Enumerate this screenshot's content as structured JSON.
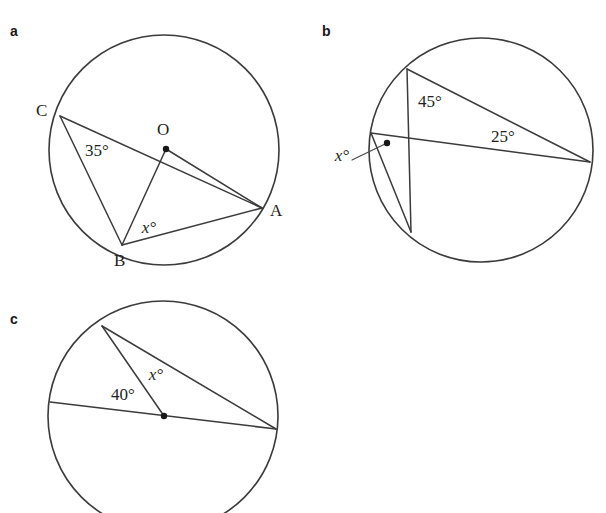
{
  "page": {
    "background": "#ffffff",
    "ink": "#3b3a3c",
    "text_color": "#231f20",
    "cut_off_line": "",
    "width": 606,
    "height": 513
  },
  "figures": [
    {
      "id": "a",
      "part_label": "a",
      "part_label_pos": {
        "x": 10,
        "y": 24
      },
      "circle": {
        "cx": 164,
        "cy": 150,
        "r": 115
      },
      "center_dot": {
        "x": 166,
        "y": 149,
        "r": 3.2
      },
      "points": [
        {
          "name": "A",
          "label": "A",
          "x": 262,
          "y": 208,
          "label_x": 270,
          "label_y": 202
        },
        {
          "name": "B",
          "label": "B",
          "x": 122,
          "y": 245,
          "label_x": 114,
          "label_y": 252
        },
        {
          "name": "C",
          "label": "C",
          "x": 60,
          "y": 116,
          "label_x": 36,
          "label_y": 102
        },
        {
          "name": "O",
          "label": "O",
          "x": 166,
          "y": 149,
          "label_x": 157,
          "label_y": 121
        }
      ],
      "segments": [
        {
          "name": "chord-CA",
          "x1": 60,
          "y1": 116,
          "x2": 262,
          "y2": 208
        },
        {
          "name": "chord-CB",
          "x1": 60,
          "y1": 116,
          "x2": 122,
          "y2": 245
        },
        {
          "name": "chord-BA",
          "x1": 122,
          "y1": 245,
          "x2": 262,
          "y2": 208
        },
        {
          "name": "radius-OB",
          "x1": 166,
          "y1": 149,
          "x2": 122,
          "y2": 245
        },
        {
          "name": "radius-OA",
          "x1": 166,
          "y1": 149,
          "x2": 262,
          "y2": 208
        }
      ],
      "angles": [
        {
          "name": "angle-35",
          "text": "35°",
          "x": 97,
          "y": 150,
          "italic": false
        },
        {
          "name": "angle-x",
          "text": "x°",
          "x": 149,
          "y": 227,
          "italic": true
        }
      ],
      "leaders": []
    },
    {
      "id": "b",
      "part_label": "b",
      "part_label_pos": {
        "x": 322,
        "y": 24
      },
      "circle": {
        "cx": 481,
        "cy": 150,
        "r": 112
      },
      "center_dot": null,
      "points": [
        {
          "name": "top-left-vertex",
          "label": "",
          "x": 407,
          "y": 69,
          "label_x": 0,
          "label_y": 0
        },
        {
          "name": "left-vertex",
          "label": "",
          "x": 371,
          "y": 133,
          "label_x": 0,
          "label_y": 0
        },
        {
          "name": "bottom-vertex",
          "label": "",
          "x": 411,
          "y": 232,
          "label_x": 0,
          "label_y": 0
        },
        {
          "name": "right-vertex",
          "label": "",
          "x": 590,
          "y": 162,
          "label_x": 0,
          "label_y": 0
        }
      ],
      "segments": [
        {
          "name": "chord-topleft-right",
          "x1": 407,
          "y1": 69,
          "x2": 590,
          "y2": 162
        },
        {
          "name": "chord-topleft-bottom",
          "x1": 407,
          "y1": 69,
          "x2": 411,
          "y2": 232
        },
        {
          "name": "chord-left-right",
          "x1": 371,
          "y1": 133,
          "x2": 590,
          "y2": 162
        },
        {
          "name": "chord-left-bottom",
          "x1": 371,
          "y1": 133,
          "x2": 411,
          "y2": 232
        }
      ],
      "angles": [
        {
          "name": "angle-45",
          "text": "45°",
          "x": 430,
          "y": 101,
          "italic": false
        },
        {
          "name": "angle-25",
          "text": "25°",
          "x": 503,
          "y": 136,
          "italic": false
        },
        {
          "name": "angle-x",
          "text": "x°",
          "x": 342,
          "y": 155,
          "italic": true
        }
      ],
      "leaders": [
        {
          "name": "leader-x",
          "x1": 352,
          "y1": 160,
          "x2": 385,
          "y2": 144,
          "dot_x": 387,
          "dot_y": 143,
          "dot_r": 3.2
        }
      ]
    },
    {
      "id": "c",
      "part_label": "c",
      "part_label_pos": {
        "x": 10,
        "y": 312
      },
      "circle": {
        "cx": 163,
        "cy": 416,
        "r": 115
      },
      "center_dot": {
        "x": 164,
        "y": 416,
        "r": 3.2
      },
      "points": [
        {
          "name": "top-vertex",
          "label": "",
          "x": 102,
          "y": 326,
          "label_x": 0,
          "label_y": 0
        },
        {
          "name": "left-vertex",
          "label": "",
          "x": 50,
          "y": 402,
          "label_x": 0,
          "label_y": 0
        },
        {
          "name": "right-vertex",
          "label": "",
          "x": 276,
          "y": 429,
          "label_x": 0,
          "label_y": 0
        }
      ],
      "segments": [
        {
          "name": "chord-top-right",
          "x1": 102,
          "y1": 326,
          "x2": 276,
          "y2": 429
        },
        {
          "name": "diameter-left-right",
          "x1": 50,
          "y1": 402,
          "x2": 276,
          "y2": 429
        },
        {
          "name": "radius-center-top",
          "x1": 164,
          "y1": 416,
          "x2": 102,
          "y2": 326
        }
      ],
      "angles": [
        {
          "name": "angle-40",
          "text": "40°",
          "x": 123,
          "y": 394,
          "italic": false
        },
        {
          "name": "angle-x",
          "text": "x°",
          "x": 156,
          "y": 374,
          "italic": true
        }
      ],
      "leaders": []
    }
  ]
}
